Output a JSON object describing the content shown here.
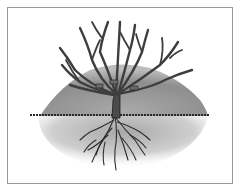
{
  "illustration": {
    "subject": "bare-root shrub planted over soil mound",
    "colors": {
      "background": "#ffffff",
      "frame": "#9a9a9a",
      "branch": "#4a4a4a",
      "branch_outline": "#1e1e1e",
      "mound": "#8c8c8c",
      "soil_below": "#c8c8c8",
      "ground_line": "#2a2a2a",
      "roots": "#2e2e2e"
    }
  }
}
